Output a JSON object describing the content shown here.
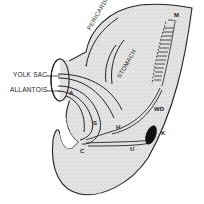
{
  "diagram": {
    "colors": {
      "background": "#ffffff",
      "tissue": "#e6e6e6",
      "outline": "#222222",
      "kidney": "#111111"
    },
    "labels": {
      "yolk_sac": "YOLK SAC",
      "allantois": "ALLANTOIS",
      "pericardium": "PERICARDIUM",
      "stomach": "STOMACH",
      "m": "M",
      "wd": "WD",
      "k": "K",
      "h": "H",
      "s": "S",
      "u": "U",
      "c": "C",
      "a": "A"
    }
  }
}
